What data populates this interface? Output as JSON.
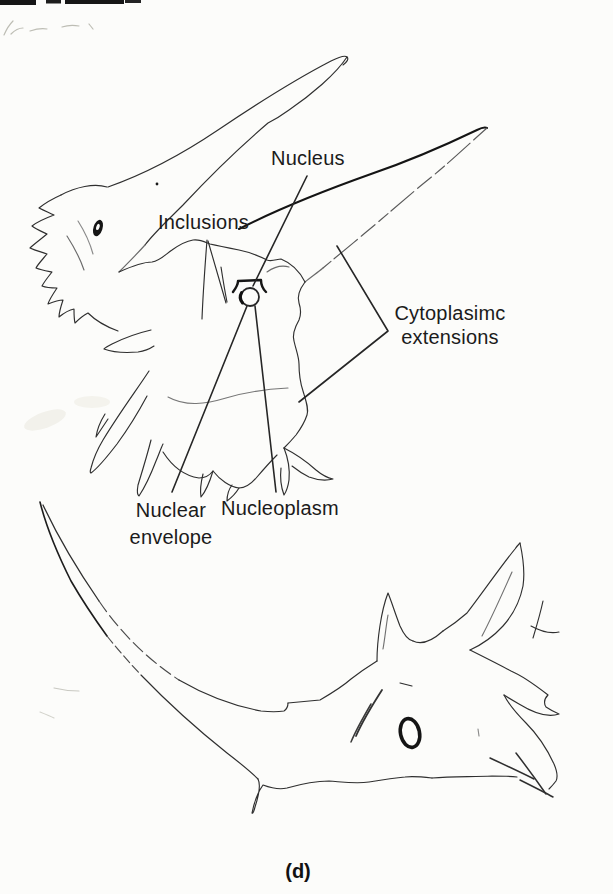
{
  "figure": {
    "caption": "(d)",
    "labels": {
      "nucleus": "Nucleus",
      "inclusions": "Inclusions",
      "cytoplasmic_extensions_line1": "Cytoplasimc",
      "cytoplasmic_extensions_line2": "extensions",
      "nuclear_envelope_line1": "Nuclear",
      "nuclear_envelope_line2": "envelope",
      "nucleoplasm": "Nucleoplasm"
    },
    "colors": {
      "paper": "#fcfcfa",
      "ink": "#2f2f2f",
      "ink_heavy": "#141414",
      "ink_light": "#6a6a6a",
      "pencil_faint": "#bdbdb4",
      "text": "#1b1b1b"
    }
  }
}
